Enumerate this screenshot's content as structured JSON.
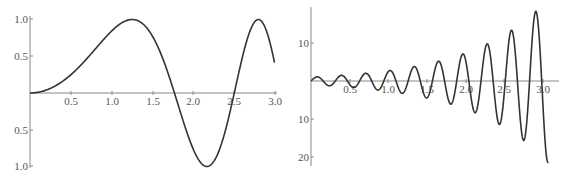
{
  "chart_data": [
    {
      "type": "line",
      "title": "",
      "xlabel": "",
      "ylabel": "",
      "function_shape": "sin(x^2)",
      "xlim": [
        0,
        3.0
      ],
      "ylim": [
        -1.0,
        1.0
      ],
      "grid": false,
      "x_ticks": [
        "0.5",
        "1.0",
        "1.5",
        "2.0",
        "2.5",
        "3.0"
      ],
      "y_ticks": [
        "1.0",
        "0.5",
        "0.5",
        "1.0"
      ],
      "series": [
        {
          "name": "curve",
          "x": [
            0,
            0.25,
            0.5,
            0.75,
            1.0,
            1.25,
            1.5,
            1.77,
            2.0,
            2.17,
            2.5,
            2.8,
            3.0
          ],
          "y": [
            0,
            0.06,
            0.25,
            0.53,
            0.84,
            1.0,
            0.78,
            0.0,
            -0.76,
            -1.0,
            -0.03,
            1.0,
            0.41
          ]
        }
      ]
    },
    {
      "type": "line",
      "title": "",
      "xlabel": "",
      "ylabel": "",
      "function_shape": "e^x * sin(20x)",
      "xlim": [
        0,
        3.0
      ],
      "ylim": [
        -21,
        19
      ],
      "grid": false,
      "x_ticks": [
        "0.5",
        "1.0",
        "1.5",
        "2.0",
        "2.5",
        "3.0"
      ],
      "y_ticks": [
        "10",
        "10",
        "20"
      ],
      "series": [
        {
          "name": "curve",
          "x": [
            0.08,
            0.24,
            0.39,
            0.55,
            0.71,
            0.86,
            1.02,
            1.18,
            1.34,
            1.49,
            1.65,
            1.81,
            1.96,
            2.12,
            2.28,
            2.43,
            2.59,
            2.75,
            2.91,
            3.06
          ],
          "y": [
            1.1,
            -1.3,
            1.5,
            -1.7,
            2.0,
            -2.4,
            2.8,
            -3.2,
            3.8,
            -4.5,
            5.2,
            -6.1,
            7.1,
            -8.3,
            9.8,
            -11.4,
            13.3,
            -15.6,
            18.3,
            -21.3
          ]
        }
      ]
    }
  ],
  "plots": {
    "left": {
      "x_tick_labels": [
        "0.5",
        "1.0",
        "1.5",
        "2.0",
        "2.5",
        "3.0"
      ],
      "y_tick_labels_pos": [
        "1.0",
        "0.5"
      ],
      "y_tick_labels_neg": [
        "0.5",
        "1.0"
      ]
    },
    "right": {
      "x_tick_labels": [
        "0.5",
        "1.0",
        "1.5",
        "2.0",
        "2.5",
        "3.0"
      ],
      "y_tick_labels_pos": [
        "10"
      ],
      "y_tick_labels_neg": [
        "10",
        "20"
      ]
    }
  }
}
